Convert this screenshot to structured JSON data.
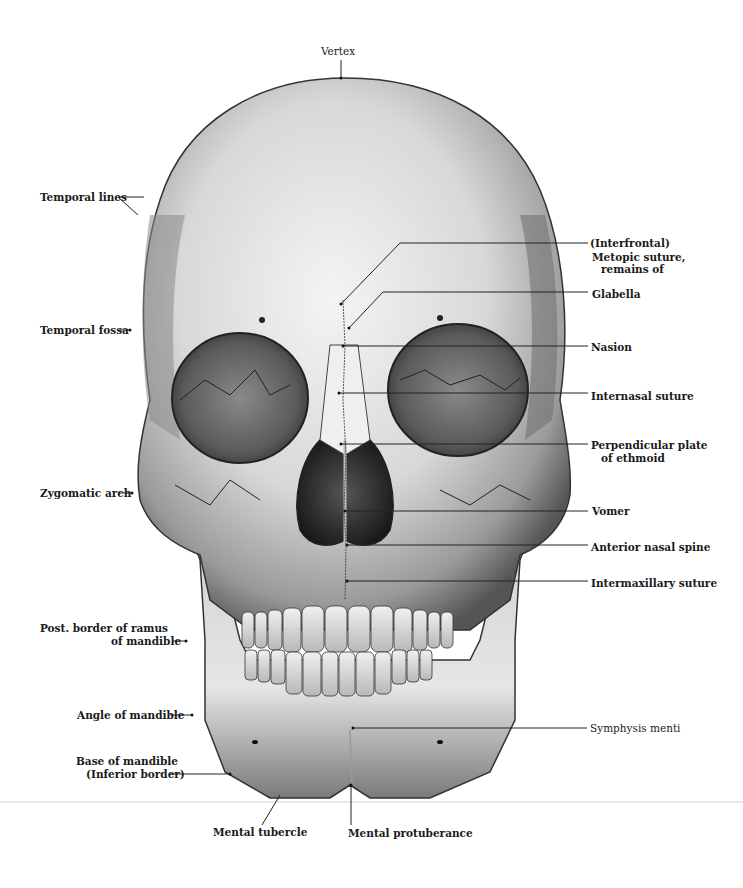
{
  "figure": {
    "labels": {
      "vertex": "Vertex",
      "temporal_lines": "Temporal lines",
      "temporal_fossa": "Temporal fossa",
      "zygomatic_arch": "Zygomatic arch",
      "post_border_ramus_1": "Post. border of ramus",
      "post_border_ramus_2": "of mandible",
      "angle_of_mandible": "Angle of mandible",
      "base_of_mandible_1": "Base of mandible",
      "base_of_mandible_2": "(Inferior border)",
      "mental_tubercle": "Mental tubercle",
      "mental_protuberance": "Mental protuberance",
      "metopic_1": "(Interfrontal)",
      "metopic_2": "Metopic suture,",
      "metopic_3": "remains of",
      "glabella": "Glabella",
      "nasion": "Nasion",
      "internasal_suture": "Internasal suture",
      "perpendicular_plate_1": "Perpendicular plate",
      "perpendicular_plate_2": "of ethmoid",
      "vomer": "Vomer",
      "anterior_nasal_spine": "Anterior nasal spine",
      "intermaxillary_suture": "Intermaxillary suture",
      "symphysis_menti": "Symphysis menti"
    }
  }
}
